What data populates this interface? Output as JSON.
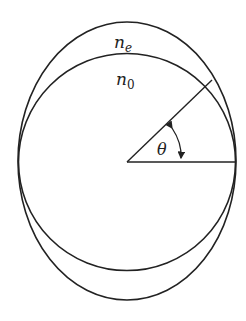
{
  "labels": {
    "ne_main": "n",
    "ne_sub": "e",
    "no_main": "n",
    "no_sub": "0",
    "angle": "θ"
  },
  "colors": {
    "stroke": "#222222",
    "background": "#ffffff"
  }
}
